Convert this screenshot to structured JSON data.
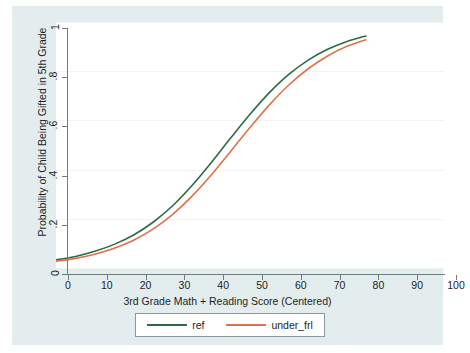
{
  "chart_data": {
    "type": "line",
    "title": "",
    "xlabel": "3rd Grade Math + Reading Score (Centered)",
    "ylabel": "Probability of Child Being Gifted in 5th Grade",
    "xlim": [
      0,
      100
    ],
    "ylim": [
      0,
      1
    ],
    "xticks": [
      0,
      10,
      20,
      30,
      40,
      50,
      60,
      70,
      80,
      90,
      100
    ],
    "xtick_labels": [
      "0",
      "10",
      "20",
      "30",
      "40",
      "50",
      "60",
      "70",
      "80",
      "90",
      "100"
    ],
    "yticks": [
      0,
      0.2,
      0.4,
      0.6,
      0.8,
      1
    ],
    "ytick_labels": [
      "0",
      ".2",
      ".4",
      ".6",
      ".8",
      "1"
    ],
    "grid": "horizontal",
    "legend_position": "bottom",
    "x": [
      0,
      5,
      10,
      15,
      20,
      25,
      30,
      35,
      40,
      45,
      50,
      55,
      60,
      65,
      70,
      75,
      80
    ],
    "series": [
      {
        "name": "ref",
        "color": "#2d6b45",
        "values": [
          0.033,
          0.047,
          0.068,
          0.096,
          0.134,
          0.186,
          0.252,
          0.334,
          0.428,
          0.528,
          0.625,
          0.713,
          0.787,
          0.845,
          0.889,
          0.921,
          0.944
        ]
      },
      {
        "name": "under_frl",
        "color": "#e0714b",
        "values": [
          0.027,
          0.039,
          0.056,
          0.08,
          0.113,
          0.158,
          0.217,
          0.291,
          0.378,
          0.474,
          0.571,
          0.663,
          0.744,
          0.81,
          0.862,
          0.901,
          0.929
        ]
      }
    ],
    "legend": [
      {
        "label": "ref",
        "color": "#2d6b45"
      },
      {
        "label": "under_frl",
        "color": "#e0714b"
      }
    ],
    "colors": {
      "figure_background": "#e4eded",
      "plot_background": "#ffffff",
      "axis": "#6f7d7d",
      "gridline": "#f2f4f4",
      "text": "#1d1d1d"
    }
  }
}
